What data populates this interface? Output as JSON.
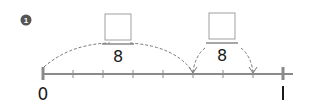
{
  "problem": {
    "number_badge": "1",
    "number_line": {
      "start_label": "0",
      "end_label": "1",
      "divisions": 8
    },
    "fractions": [
      {
        "numerator": "",
        "denominator": "8"
      },
      {
        "numerator": "",
        "denominator": "8"
      }
    ],
    "colors": {
      "line": "#8a8a8a",
      "dashed_arc": "#777777",
      "answer_box": "#a0a0a0",
      "badge": "#555555",
      "text": "#1a1a1a"
    }
  }
}
